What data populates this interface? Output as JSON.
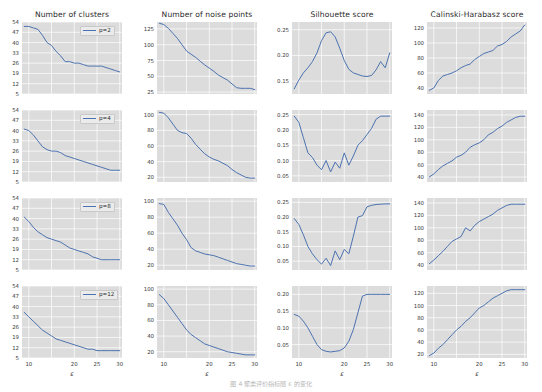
{
  "figure": {
    "background": "#ffffff",
    "panel_background": "#dcdcdc",
    "grid_color": "#ffffff",
    "line_color": "#4c72b0",
    "caption": "图 4   聚类评价指标随 ε 的变化",
    "xlabel": "ε",
    "column_titles": [
      "Number of clusters",
      "Number of noise points",
      "Silhouette score",
      "Calinski-Harabasz score"
    ],
    "row_legends": [
      "p=2",
      "p=4",
      "p=8",
      "p=12"
    ],
    "xticks": [
      "10",
      "15",
      "20",
      "25",
      "30"
    ]
  },
  "chart_data": {
    "type": "line",
    "title": "",
    "xlabel": "ε",
    "grid": true,
    "legend_position": "upper-right",
    "xlim": [
      8.5,
      30.5
    ],
    "x": [
      9,
      10,
      11,
      12,
      13,
      14,
      15,
      16,
      17,
      18,
      19,
      20,
      21,
      22,
      23,
      24,
      25,
      26,
      27,
      28,
      29,
      30
    ],
    "panels": [
      {
        "row": 0,
        "col": 0,
        "title": "Number of clusters",
        "legend": "p=2",
        "ylabel": "",
        "yticks": [
          54,
          47,
          40,
          33,
          26,
          19,
          12,
          5
        ],
        "ylim": [
          5,
          54
        ],
        "series": [
          {
            "name": "p=2",
            "values": [
              51,
              51,
              50,
              49,
              45,
              40,
              38,
              34,
              31,
              27,
              27,
              26,
              26,
              25,
              24,
              24,
              24,
              24,
              23,
              22,
              21,
              20
            ]
          }
        ]
      },
      {
        "row": 0,
        "col": 1,
        "title": "Number of noise points",
        "legend": "p=2",
        "ylabel": "",
        "yticks": [
          125,
          100,
          75,
          50,
          25
        ],
        "ylim": [
          22,
          136
        ],
        "series": [
          {
            "name": "p=2",
            "values": [
              134,
              132,
              126,
              118,
              110,
              100,
              90,
              85,
              80,
              74,
              68,
              63,
              58,
              52,
              48,
              44,
              38,
              32,
              31,
              31,
              31,
              29
            ]
          }
        ]
      },
      {
        "row": 0,
        "col": 2,
        "title": "Silhouette score",
        "legend": "p=2",
        "ylabel": "",
        "yticks": [
          0.25,
          0.2,
          0.15
        ],
        "ylim": [
          0.125,
          0.265
        ],
        "series": [
          {
            "name": "p=2",
            "values": [
              0.135,
              0.152,
              0.166,
              0.176,
              0.188,
              0.205,
              0.229,
              0.244,
              0.246,
              0.236,
              0.214,
              0.19,
              0.173,
              0.166,
              0.163,
              0.16,
              0.159,
              0.161,
              0.172,
              0.188,
              0.176,
              0.205
            ]
          }
        ]
      },
      {
        "row": 0,
        "col": 3,
        "title": "Calinski-Harabasz score",
        "legend": "p=2",
        "ylabel": "",
        "yticks": [
          120,
          100,
          80,
          60,
          40
        ],
        "ylim": [
          32,
          128
        ],
        "series": [
          {
            "name": "p=2",
            "values": [
              37,
              40,
              50,
              56,
              58,
              60,
              63,
              67,
              70,
              72,
              78,
              82,
              86,
              88,
              90,
              96,
              98,
              102,
              108,
              112,
              116,
              124
            ]
          }
        ]
      },
      {
        "row": 1,
        "col": 0,
        "title": "Number of clusters",
        "legend": "p=4",
        "ylabel": "",
        "yticks": [
          54,
          47,
          40,
          33,
          26,
          19,
          12,
          5
        ],
        "ylim": [
          5,
          54
        ],
        "series": [
          {
            "name": "p=4",
            "values": [
              41,
              40,
              37,
              33,
              29,
              27,
              26,
              26,
              25,
              23,
              22,
              21,
              20,
              19,
              18,
              17,
              16,
              15,
              14,
              13,
              13,
              13
            ]
          }
        ]
      },
      {
        "row": 1,
        "col": 1,
        "title": "Number of noise points",
        "legend": "p=4",
        "ylabel": "",
        "yticks": [
          100,
          80,
          60,
          40,
          20
        ],
        "ylim": [
          14,
          106
        ],
        "series": [
          {
            "name": "p=4",
            "values": [
              103,
              102,
              96,
              88,
              80,
              77,
              76,
              70,
              62,
              56,
              50,
              46,
              43,
              41,
              38,
              35,
              30,
              26,
              23,
              20,
              19,
              19
            ]
          }
        ]
      },
      {
        "row": 1,
        "col": 2,
        "title": "Silhouette score",
        "legend": "p=4",
        "ylabel": "",
        "yticks": [
          0.25,
          0.2,
          0.15,
          0.1,
          0.05
        ],
        "ylim": [
          0.03,
          0.265
        ],
        "series": [
          {
            "name": "p=4",
            "values": [
              0.245,
              0.225,
              0.175,
              0.125,
              0.11,
              0.085,
              0.07,
              0.1,
              0.063,
              0.095,
              0.075,
              0.125,
              0.085,
              0.115,
              0.15,
              0.165,
              0.185,
              0.205,
              0.235,
              0.245,
              0.245,
              0.245
            ]
          }
        ]
      },
      {
        "row": 1,
        "col": 3,
        "title": "Calinski-Harabasz score",
        "legend": "p=4",
        "ylabel": "",
        "yticks": [
          140,
          120,
          100,
          80,
          60,
          40
        ],
        "ylim": [
          32,
          148
        ],
        "series": [
          {
            "name": "p=4",
            "values": [
              40,
              45,
              52,
              58,
              62,
              66,
              72,
              75,
              80,
              88,
              92,
              95,
              100,
              108,
              112,
              118,
              122,
              128,
              132,
              136,
              138,
              138
            ]
          }
        ]
      },
      {
        "row": 2,
        "col": 0,
        "title": "Number of clusters",
        "legend": "p=8",
        "ylabel": "",
        "yticks": [
          54,
          47,
          40,
          33,
          26,
          19,
          12,
          5
        ],
        "ylim": [
          5,
          54
        ],
        "series": [
          {
            "name": "p=8",
            "values": [
              41,
              38,
              34,
              31,
              29,
              27,
              26,
              25,
              24,
              22,
              20,
              19,
              18,
              17,
              16,
              14,
              13,
              12,
              12,
              12,
              12,
              12
            ]
          }
        ]
      },
      {
        "row": 2,
        "col": 1,
        "title": "Number of noise points",
        "legend": "p=8",
        "ylabel": "",
        "yticks": [
          100,
          80,
          60,
          40,
          20
        ],
        "ylim": [
          14,
          104
        ],
        "series": [
          {
            "name": "p=8",
            "values": [
              97,
              96,
              86,
              78,
              70,
              60,
              52,
              42,
              38,
              36,
              34,
              33,
              32,
              30,
              28,
              26,
              24,
              22,
              21,
              20,
              19,
              19
            ]
          }
        ]
      },
      {
        "row": 2,
        "col": 2,
        "title": "Silhouette score",
        "legend": "p=8",
        "ylabel": "",
        "yticks": [
          0.25,
          0.2,
          0.15,
          0.1,
          0.05
        ],
        "ylim": [
          0.02,
          0.265
        ],
        "series": [
          {
            "name": "p=8",
            "values": [
              0.195,
              0.175,
              0.14,
              0.1,
              0.075,
              0.055,
              0.04,
              0.06,
              0.035,
              0.085,
              0.055,
              0.09,
              0.075,
              0.135,
              0.2,
              0.205,
              0.235,
              0.24,
              0.243,
              0.244,
              0.245,
              0.245
            ]
          }
        ]
      },
      {
        "row": 2,
        "col": 3,
        "title": "Calinski-Harabasz score",
        "legend": "p=8",
        "ylabel": "",
        "yticks": [
          140,
          120,
          100,
          80,
          60,
          40
        ],
        "ylim": [
          32,
          148
        ],
        "series": [
          {
            "name": "p=8",
            "values": [
              42,
              48,
              55,
              62,
              70,
              78,
              82,
              86,
              100,
              95,
              104,
              110,
              114,
              118,
              122,
              128,
              132,
              136,
              138,
              138,
              138,
              138
            ]
          }
        ]
      },
      {
        "row": 3,
        "col": 0,
        "title": "Number of clusters",
        "legend": "p=12",
        "ylabel": "",
        "yticks": [
          54,
          47,
          40,
          33,
          26,
          19,
          12,
          5
        ],
        "ylim": [
          5,
          54
        ],
        "series": [
          {
            "name": "p=12",
            "values": [
              36,
              33,
              30,
              27,
              24,
              22,
              20,
              18,
              17,
              16,
              15,
              14,
              13,
              12,
              11,
              11,
              10,
              10,
              10,
              10,
              10,
              10
            ]
          }
        ]
      },
      {
        "row": 3,
        "col": 1,
        "title": "Number of noise points",
        "legend": "p=12",
        "ylabel": "",
        "yticks": [
          100,
          80,
          60,
          40,
          20
        ],
        "ylim": [
          12,
          104
        ],
        "series": [
          {
            "name": "p=12",
            "values": [
              93,
              88,
              80,
              72,
              64,
              56,
              48,
              42,
              38,
              34,
              30,
              28,
              26,
              24,
              22,
              20,
              19,
              18,
              17,
              16,
              16,
              16
            ]
          }
        ]
      },
      {
        "row": 3,
        "col": 2,
        "title": "Silhouette score",
        "legend": "p=12",
        "ylabel": "",
        "yticks": [
          0.2,
          0.15,
          0.1,
          0.05
        ],
        "ylim": [
          0.01,
          0.225
        ],
        "series": [
          {
            "name": "p=12",
            "values": [
              0.14,
              0.135,
              0.12,
              0.1,
              0.075,
              0.05,
              0.035,
              0.03,
              0.028,
              0.03,
              0.032,
              0.04,
              0.06,
              0.095,
              0.145,
              0.195,
              0.2,
              0.2,
              0.2,
              0.2,
              0.2,
              0.2
            ]
          }
        ]
      },
      {
        "row": 3,
        "col": 3,
        "title": "Calinski-Harabasz score",
        "legend": "p=12",
        "ylabel": "",
        "yticks": [
          120,
          100,
          80,
          60,
          40,
          20
        ],
        "ylim": [
          14,
          132
        ],
        "series": [
          {
            "name": "p=12",
            "values": [
              18,
              22,
              30,
              36,
              44,
              52,
              60,
              66,
              74,
              80,
              88,
              96,
              100,
              106,
              112,
              116,
              120,
              124,
              126,
              126,
              126,
              126
            ]
          }
        ]
      }
    ]
  }
}
